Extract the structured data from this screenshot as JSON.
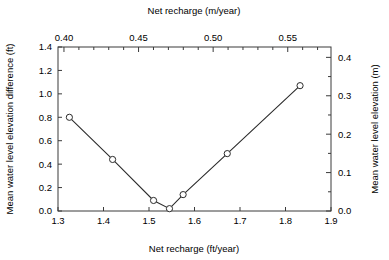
{
  "chart_data": {
    "type": "line",
    "title": "",
    "xlabel": "Net recharge (ft/year)",
    "ylabel": "Mean water level elevation difference (ft)",
    "top_axis_label": "Net recharge (m/year)",
    "right_axis_label": "Mean water level elevation (m)",
    "xlim": [
      1.3,
      1.9
    ],
    "ylim": [
      0.0,
      1.4
    ],
    "top_xlim": [
      0.396,
      0.579
    ],
    "right_ylim": [
      0.0,
      0.427
    ],
    "grid": false,
    "legend": null,
    "x": [
      1.325,
      1.42,
      1.51,
      1.545,
      1.575,
      1.672,
      1.832
    ],
    "values": [
      0.8,
      0.44,
      0.09,
      0.02,
      0.14,
      0.49,
      1.07
    ],
    "marker": "open-circle",
    "xticks": [
      "1.3",
      "1.4",
      "1.5",
      "1.6",
      "1.7",
      "1.8",
      "1.9"
    ],
    "xtick_values": [
      1.3,
      1.4,
      1.5,
      1.6,
      1.7,
      1.8,
      1.9
    ],
    "yticks": [
      "0.0",
      "0.2",
      "0.4",
      "0.6",
      "0.8",
      "1.0",
      "1.2",
      "1.4"
    ],
    "ytick_values": [
      0.0,
      0.2,
      0.4,
      0.6,
      0.8,
      1.0,
      1.2,
      1.4
    ],
    "top_xticks": [
      "0.40",
      "0.45",
      "0.50",
      "0.55"
    ],
    "top_xtick_values": [
      0.4,
      0.45,
      0.5,
      0.55
    ],
    "top_minor_xtick_values": [
      0.41,
      0.42,
      0.43,
      0.44,
      0.46,
      0.47,
      0.48,
      0.49,
      0.51,
      0.52,
      0.53,
      0.54,
      0.56,
      0.57
    ],
    "right_yticks": [
      "0.0",
      "0.1",
      "0.2",
      "0.3",
      "0.4"
    ],
    "right_ytick_values": [
      0.0,
      0.1,
      0.2,
      0.3,
      0.4
    ],
    "right_minor_ytick_values": [
      0.05,
      0.15,
      0.25,
      0.35
    ],
    "colors": {
      "line": "#2b2b2b",
      "marker_fill": "#ffffff",
      "marker_stroke": "#2b2b2b",
      "axis": "#3a3a3a",
      "background": "#ffffff"
    }
  }
}
